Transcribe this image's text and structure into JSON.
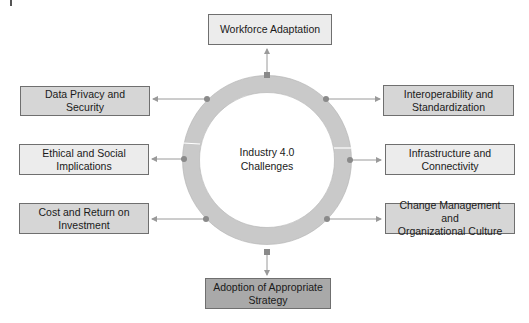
{
  "diagram": {
    "center": {
      "line1": "Industry 4.0",
      "line2": "Challenges"
    },
    "nodes": [
      {
        "id": "top",
        "line1": "Workforce Adaptation",
        "line2": "",
        "shade": "light"
      },
      {
        "id": "upper-left",
        "line1": "Data Privacy and Security",
        "line2": "",
        "shade": "mid"
      },
      {
        "id": "upper-right",
        "line1": "Interoperability and",
        "line2": "Standardization",
        "shade": "mid"
      },
      {
        "id": "middle-left",
        "line1": "Ethical and Social",
        "line2": "Implications",
        "shade": "light"
      },
      {
        "id": "middle-right",
        "line1": "Infrastructure and",
        "line2": "Connectivity",
        "shade": "light"
      },
      {
        "id": "lower-left",
        "line1": "Cost and Return on",
        "line2": "Investment",
        "shade": "mid"
      },
      {
        "id": "lower-right",
        "line1": "Change Management and",
        "line2": "Organizational Culture",
        "shade": "mid"
      },
      {
        "id": "bottom",
        "line1": "Adoption of Appropriate",
        "line2": "Strategy",
        "shade": "dark"
      }
    ],
    "colors": {
      "ring": "#c9c9c9",
      "ring_stroke": "#a0a0a0",
      "connector": "#9a9a9a",
      "dot": "#8a8a8a",
      "box_light": "#ececec",
      "box_mid": "#d6d6d6",
      "box_dark": "#a9a9a9"
    }
  }
}
